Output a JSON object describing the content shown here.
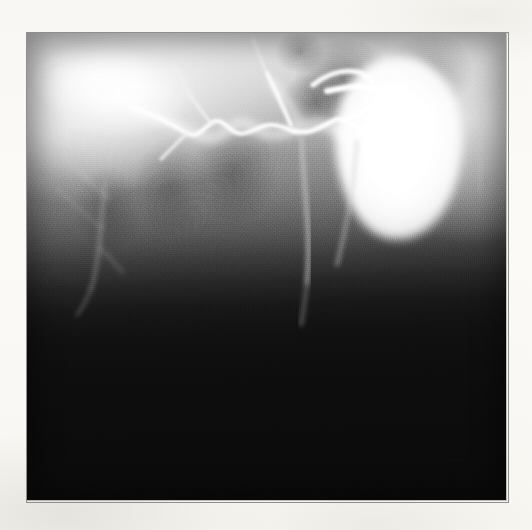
{
  "page": {
    "background_color": "#faf9f6",
    "width": 532,
    "height": 530
  },
  "image": {
    "kind": "radiograph",
    "modality_label": "X-ray cholangiogram",
    "caption": "",
    "alt_text": "Grayscale radiograph showing branching biliary ducts opacified with contrast and a large contrast-filled gallbladder at the upper right; the lower half of the film is underexposed and black.",
    "frame": {
      "x": 27,
      "y": 33,
      "width": 479,
      "height": 467
    },
    "border_color": "#8e8e8e",
    "tone": {
      "highlight_color": "#ffffff",
      "midtone_color": "#8e8e8e",
      "shadow_color": "#0a0a0a",
      "gradient_direction": "top-bright to bottom-black"
    },
    "structures": [
      {
        "name": "gallbladder",
        "description": "Large ovoid contrast-filled gallbladder",
        "center_x": 399,
        "center_y": 147,
        "width": 128,
        "height": 185,
        "brightness": "very-bright"
      },
      {
        "name": "cystic-duct",
        "description": "Bright duct entering the gallbladder neck from the left",
        "brightness": "bright"
      },
      {
        "name": "common-bile-duct",
        "description": "Thin vertical duct descending through the mid-field",
        "brightness": "moderate"
      },
      {
        "name": "intrahepatic-duct-tree",
        "description": "Zig-zag branching intrahepatic ducts across the upper-left and mid field",
        "brightness": "bright"
      },
      {
        "name": "hepatic-parenchyma-haze",
        "description": "Diffuse bright contrast pooling in the upper-left quadrant",
        "brightness": "bright"
      },
      {
        "name": "bowel-gas-shadows",
        "description": "Mottled darker patches in the upper mid-field",
        "brightness": "dark"
      },
      {
        "name": "underexposed-field",
        "description": "Black underexposed lower half of the film",
        "brightness": "black"
      }
    ]
  }
}
